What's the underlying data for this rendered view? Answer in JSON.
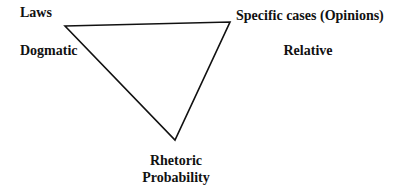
{
  "diagram": {
    "type": "triangle",
    "vertices": {
      "left": {
        "title": "Laws",
        "subtitle": "Dogmatic"
      },
      "right": {
        "title": "Specific cases (Opinions)",
        "subtitle": "Relative"
      },
      "bottom": {
        "title": "Rhetoric",
        "subtitle": "Probability"
      }
    },
    "colors": {
      "line": "#111111",
      "text": "#111111",
      "background": "#ffffff"
    }
  }
}
